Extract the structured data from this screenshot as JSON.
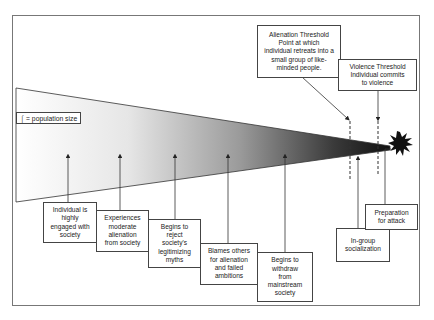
{
  "diagram": {
    "legend": "⌠ = population size",
    "thresholds": [
      {
        "id": "alienation",
        "text": "Alienation Threshold\nPoint at which\nindividual retreats into a\nsmall group of like-\nminded people."
      },
      {
        "id": "violence",
        "text": "Violence Threshold\nIndividual commits\nto violence"
      }
    ],
    "stages": [
      {
        "id": "engaged",
        "text": "Individual is\nhighly\nengaged with\nsociety"
      },
      {
        "id": "moderate",
        "text": "Experiences\nmoderate\nalienation\nfrom society"
      },
      {
        "id": "reject",
        "text": "Begins to\nreject\nsociety's\nlegitimizing\nmyths"
      },
      {
        "id": "blames",
        "text": "Blames others\nfor alienation\nand failed\nambitions"
      },
      {
        "id": "withdraw",
        "text": "Begins to\nwithdraw\nfrom\nmainstream\nsociety"
      },
      {
        "id": "ingroup",
        "text": "In-group\nsocialization"
      },
      {
        "id": "preparation",
        "text": "Preparation\nfor attack"
      }
    ],
    "colors": {
      "wedge_start": "#ffffff",
      "wedge_end": "#111111",
      "line": "#333333",
      "frame": "#777777"
    }
  }
}
